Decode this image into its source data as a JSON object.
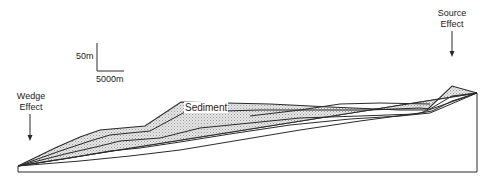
{
  "figure": {
    "scale_bar": {
      "vertical_label": "50m",
      "horizontal_label": "5000m"
    },
    "labels": {
      "wedge_effect": [
        "Wedge",
        "Effect"
      ],
      "source_effect": [
        "Source",
        "Effect"
      ],
      "sediment": "Sediment"
    },
    "colors": {
      "line": "#2a2a2a",
      "sediment_fill": "#d9d9d9",
      "background": "#ffffff"
    }
  }
}
